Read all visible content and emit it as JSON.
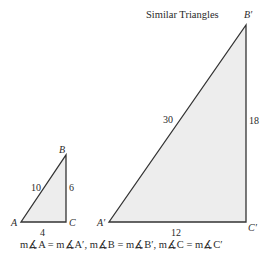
{
  "title": "Similar Triangles",
  "small_triangle": {
    "vertices": {
      "A": "A",
      "B": "B",
      "C": "C"
    },
    "sides": {
      "AB": "10",
      "BC": "6",
      "AC": "4"
    }
  },
  "large_triangle": {
    "vertices": {
      "A": "A′",
      "B": "B′",
      "C": "C′"
    },
    "sides": {
      "AB": "30",
      "BC": "18",
      "AC": "12"
    }
  },
  "caption": "m∡A = m∡A′, m∡B = m∡B′, m∡C = m∡C′",
  "colors": {
    "fill": "#ededed",
    "stroke": "#333333"
  }
}
